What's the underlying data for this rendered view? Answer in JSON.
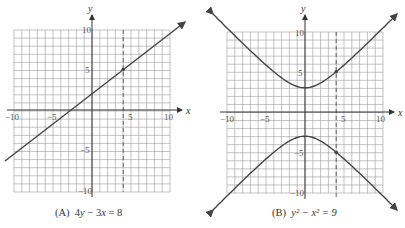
{
  "chart_data": [
    {
      "type": "line",
      "title": "(A) 4y − 3x = 8",
      "caption_label": "(A)",
      "equation": "4y − 3x = 8",
      "xlabel": "x",
      "ylabel": "y",
      "xlim": [
        -10,
        10
      ],
      "ylim": [
        -10,
        10
      ],
      "grid": true,
      "x_ticks": [
        "−10",
        "−5",
        "5",
        "10"
      ],
      "y_ticks": [
        "10",
        "5",
        "−5",
        "−10"
      ],
      "series": [
        {
          "name": "4y − 3x = 8",
          "x": [
            -11.5,
            12
          ],
          "y": [
            -6.625,
            11
          ]
        }
      ],
      "annotations": {
        "dashed_vertical_line_x": 4,
        "marked_point": [
          4,
          5
        ]
      }
    },
    {
      "type": "line",
      "title": "(B) y² − x² = 9",
      "caption_label": "(B)",
      "equation": "y² − x² = 9",
      "xlabel": "x",
      "ylabel": "y",
      "xlim": [
        -10,
        10
      ],
      "ylim": [
        -10,
        10
      ],
      "grid": true,
      "x_ticks": [
        "−10",
        "−5",
        "5",
        "10"
      ],
      "y_ticks": [
        "10",
        "5",
        "−5",
        "−10"
      ],
      "series": [
        {
          "name": "upper branch y = √(x²+9)",
          "x": [
            -11,
            -8,
            -4,
            0,
            4,
            8,
            11
          ],
          "y": [
            11.4,
            8.54,
            5,
            3,
            5,
            8.54,
            11.4
          ]
        },
        {
          "name": "lower branch y = −√(x²+9)",
          "x": [
            -11,
            -8,
            -4,
            0,
            4,
            8,
            11
          ],
          "y": [
            -11.4,
            -8.54,
            -5,
            -3,
            -5,
            -8.54,
            -11.4
          ]
        }
      ],
      "annotations": {
        "dashed_vertical_line_x": 4,
        "marked_points": [
          [
            4,
            5
          ],
          [
            4,
            -5
          ]
        ]
      }
    }
  ],
  "captions": {
    "a_label": "(A)",
    "a_eq_pre": "4",
    "a_eq_y": "y",
    "a_eq_mid": " − 3",
    "a_eq_x": "x",
    "a_eq_post": " = 8",
    "b_label": "(B)",
    "b_eq": "y² − x² = 9"
  },
  "axes": {
    "x": "x",
    "y": "y"
  },
  "ticks": {
    "m10": "−10",
    "m5": "−5",
    "p5": "5",
    "p10": "10"
  }
}
